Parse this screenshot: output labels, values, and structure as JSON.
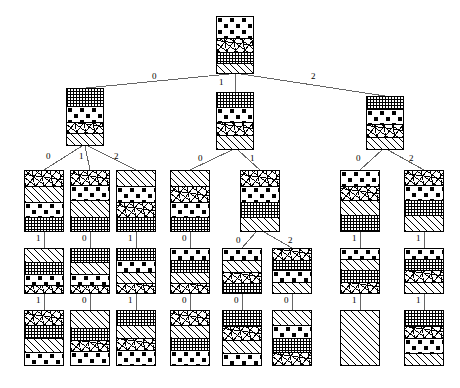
{
  "figure": {
    "title": "",
    "type": "decision-tree-diagram",
    "background_color": "#ffffff",
    "line_color": "#555555",
    "border_color": "#000000",
    "label_color": "#000000"
  },
  "patterns": {
    "dots": "polka-dot-fill",
    "grid": "crosshatch-grid-fill",
    "scribble": "random-scribble-fill",
    "hatch": "diagonal-hatch-fill",
    "speckle": "light-speckle-fill"
  },
  "edge_labels": {
    "l1": [
      "0",
      "1",
      "2"
    ],
    "l2_left": [
      "0",
      "1",
      "2"
    ],
    "l2_mid": [
      "0",
      "1"
    ],
    "l2_right": [
      "0",
      "2"
    ],
    "l3": [
      "1",
      "0",
      "1",
      "0",
      "0",
      "2",
      "1",
      "1"
    ],
    "l4": [
      "1",
      "0",
      "1",
      "0",
      "0",
      "0",
      "1",
      "1"
    ]
  },
  "nodes": [
    {
      "id": "root",
      "x": 216,
      "y": 16,
      "w": 38,
      "h": 58,
      "segs": [
        {
          "p": "dots",
          "h": 22
        },
        {
          "p": "scribble",
          "h": 14
        },
        {
          "p": "grid",
          "h": 12
        },
        {
          "p": "hatch",
          "h": 10
        }
      ]
    },
    {
      "id": "n-l",
      "x": 66,
      "y": 88,
      "w": 38,
      "h": 58,
      "segs": [
        {
          "p": "grid",
          "h": 18
        },
        {
          "p": "dots",
          "h": 16
        },
        {
          "p": "scribble",
          "h": 12
        },
        {
          "p": "hatch",
          "h": 12
        }
      ]
    },
    {
      "id": "n-m",
      "x": 216,
      "y": 92,
      "w": 38,
      "h": 58,
      "segs": [
        {
          "p": "grid",
          "h": 14
        },
        {
          "p": "dots",
          "h": 16
        },
        {
          "p": "scribble",
          "h": 14
        },
        {
          "p": "hatch",
          "h": 14
        }
      ]
    },
    {
      "id": "n-r",
      "x": 366,
      "y": 96,
      "w": 38,
      "h": 54,
      "segs": [
        {
          "p": "grid",
          "h": 12
        },
        {
          "p": "dots",
          "h": 16
        },
        {
          "p": "scribble",
          "h": 14
        },
        {
          "p": "hatch",
          "h": 12
        }
      ]
    },
    {
      "id": "n-l0",
      "x": 24,
      "y": 170,
      "w": 40,
      "h": 62,
      "segs": [
        {
          "p": "scribble",
          "h": 16
        },
        {
          "p": "hatch",
          "h": 16
        },
        {
          "p": "dots",
          "h": 16
        },
        {
          "p": "grid",
          "h": 14
        }
      ]
    },
    {
      "id": "n-l1",
      "x": 70,
      "y": 170,
      "w": 40,
      "h": 62,
      "segs": [
        {
          "p": "scribble",
          "h": 14
        },
        {
          "p": "dots",
          "h": 16
        },
        {
          "p": "hatch",
          "h": 18
        },
        {
          "p": "grid",
          "h": 14
        }
      ]
    },
    {
      "id": "n-l2",
      "x": 116,
      "y": 170,
      "w": 40,
      "h": 62,
      "segs": [
        {
          "p": "hatch",
          "h": 16
        },
        {
          "p": "dots",
          "h": 16
        },
        {
          "p": "scribble",
          "h": 16
        },
        {
          "p": "grid",
          "h": 14
        }
      ]
    },
    {
      "id": "n-m0",
      "x": 170,
      "y": 170,
      "w": 40,
      "h": 62,
      "segs": [
        {
          "p": "hatch",
          "h": 16
        },
        {
          "p": "scribble",
          "h": 16
        },
        {
          "p": "dots",
          "h": 16
        },
        {
          "p": "grid",
          "h": 14
        }
      ]
    },
    {
      "id": "n-m1",
      "x": 240,
      "y": 170,
      "w": 40,
      "h": 62,
      "segs": [
        {
          "p": "scribble",
          "h": 16
        },
        {
          "p": "dots",
          "h": 16
        },
        {
          "p": "grid",
          "h": 16
        },
        {
          "p": "hatch",
          "h": 14
        }
      ]
    },
    {
      "id": "n-r0",
      "x": 340,
      "y": 170,
      "w": 40,
      "h": 62,
      "segs": [
        {
          "p": "dots",
          "h": 16
        },
        {
          "p": "scribble",
          "h": 14
        },
        {
          "p": "hatch",
          "h": 16
        },
        {
          "p": "grid",
          "h": 16
        }
      ]
    },
    {
      "id": "n-r2",
      "x": 404,
      "y": 170,
      "w": 40,
      "h": 62,
      "segs": [
        {
          "p": "scribble",
          "h": 14
        },
        {
          "p": "dots",
          "h": 16
        },
        {
          "p": "grid",
          "h": 16
        },
        {
          "p": "hatch",
          "h": 16
        }
      ]
    },
    {
      "id": "n-l0a",
      "x": 24,
      "y": 248,
      "w": 40,
      "h": 46,
      "segs": [
        {
          "p": "hatch",
          "h": 14
        },
        {
          "p": "grid",
          "h": 12
        },
        {
          "p": "dots",
          "h": 12
        },
        {
          "p": "scribble",
          "h": 8
        }
      ]
    },
    {
      "id": "n-l1a",
      "x": 70,
      "y": 248,
      "w": 40,
      "h": 46,
      "segs": [
        {
          "p": "grid",
          "h": 14
        },
        {
          "p": "hatch",
          "h": 12
        },
        {
          "p": "dots",
          "h": 12
        },
        {
          "p": "scribble",
          "h": 8
        }
      ]
    },
    {
      "id": "n-l2a",
      "x": 116,
      "y": 248,
      "w": 40,
      "h": 46,
      "segs": [
        {
          "p": "grid",
          "h": 12
        },
        {
          "p": "dots",
          "h": 12
        },
        {
          "p": "hatch",
          "h": 12
        },
        {
          "p": "scribble",
          "h": 10
        }
      ]
    },
    {
      "id": "n-m0a",
      "x": 170,
      "y": 248,
      "w": 40,
      "h": 46,
      "segs": [
        {
          "p": "dots",
          "h": 12
        },
        {
          "p": "grid",
          "h": 12
        },
        {
          "p": "hatch",
          "h": 12
        },
        {
          "p": "scribble",
          "h": 10
        }
      ]
    },
    {
      "id": "n-m1a",
      "x": 222,
      "y": 248,
      "w": 40,
      "h": 46,
      "segs": [
        {
          "p": "dots",
          "h": 12
        },
        {
          "p": "hatch",
          "h": 12
        },
        {
          "p": "scribble",
          "h": 12
        },
        {
          "p": "grid",
          "h": 10
        }
      ]
    },
    {
      "id": "n-m1b",
      "x": 272,
      "y": 248,
      "w": 40,
      "h": 46,
      "segs": [
        {
          "p": "scribble",
          "h": 12
        },
        {
          "p": "grid",
          "h": 10
        },
        {
          "p": "dots",
          "h": 12
        },
        {
          "p": "hatch",
          "h": 12
        }
      ]
    },
    {
      "id": "n-r0a",
      "x": 340,
      "y": 248,
      "w": 40,
      "h": 46,
      "segs": [
        {
          "p": "dots",
          "h": 10
        },
        {
          "p": "hatch",
          "h": 12
        },
        {
          "p": "grid",
          "h": 12
        },
        {
          "p": "scribble",
          "h": 12
        }
      ]
    },
    {
      "id": "n-r2a",
      "x": 404,
      "y": 248,
      "w": 40,
      "h": 46,
      "segs": [
        {
          "p": "dots",
          "h": 10
        },
        {
          "p": "grid",
          "h": 12
        },
        {
          "p": "scribble",
          "h": 12
        },
        {
          "p": "hatch",
          "h": 12
        }
      ]
    },
    {
      "id": "n-l0b",
      "x": 24,
      "y": 310,
      "w": 40,
      "h": 56,
      "segs": [
        {
          "p": "scribble",
          "h": 14
        },
        {
          "p": "grid",
          "h": 14
        },
        {
          "p": "hatch",
          "h": 14
        },
        {
          "p": "dots",
          "h": 14
        }
      ]
    },
    {
      "id": "n-l1b",
      "x": 70,
      "y": 310,
      "w": 40,
      "h": 56,
      "segs": [
        {
          "p": "hatch",
          "h": 18
        },
        {
          "p": "grid",
          "h": 12
        },
        {
          "p": "scribble",
          "h": 12
        },
        {
          "p": "dots",
          "h": 14
        }
      ]
    },
    {
      "id": "n-l2b",
      "x": 116,
      "y": 310,
      "w": 40,
      "h": 56,
      "segs": [
        {
          "p": "grid",
          "h": 14
        },
        {
          "p": "hatch",
          "h": 14
        },
        {
          "p": "scribble",
          "h": 12
        },
        {
          "p": "dots",
          "h": 16
        }
      ]
    },
    {
      "id": "n-m0b",
      "x": 170,
      "y": 310,
      "w": 40,
      "h": 56,
      "segs": [
        {
          "p": "scribble",
          "h": 14
        },
        {
          "p": "hatch",
          "h": 14
        },
        {
          "p": "grid",
          "h": 12
        },
        {
          "p": "dots",
          "h": 16
        }
      ]
    },
    {
      "id": "n-m1ab",
      "x": 222,
      "y": 310,
      "w": 40,
      "h": 56,
      "segs": [
        {
          "p": "grid",
          "h": 16
        },
        {
          "p": "scribble",
          "h": 14
        },
        {
          "p": "hatch",
          "h": 14
        },
        {
          "p": "dots",
          "h": 12
        }
      ]
    },
    {
      "id": "n-m1bb",
      "x": 272,
      "y": 310,
      "w": 40,
      "h": 56,
      "segs": [
        {
          "p": "hatch",
          "h": 14
        },
        {
          "p": "dots",
          "h": 14
        },
        {
          "p": "grid",
          "h": 14
        },
        {
          "p": "scribble",
          "h": 14
        }
      ]
    },
    {
      "id": "n-r0b",
      "x": 340,
      "y": 310,
      "w": 40,
      "h": 56,
      "segs": [
        {
          "p": "hatch",
          "h": 56
        }
      ]
    },
    {
      "id": "n-r2b",
      "x": 404,
      "y": 310,
      "w": 40,
      "h": 56,
      "segs": [
        {
          "p": "grid",
          "h": 16
        },
        {
          "p": "scribble",
          "h": 12
        },
        {
          "p": "dots",
          "h": 16
        },
        {
          "p": "hatch",
          "h": 12
        }
      ]
    }
  ]
}
